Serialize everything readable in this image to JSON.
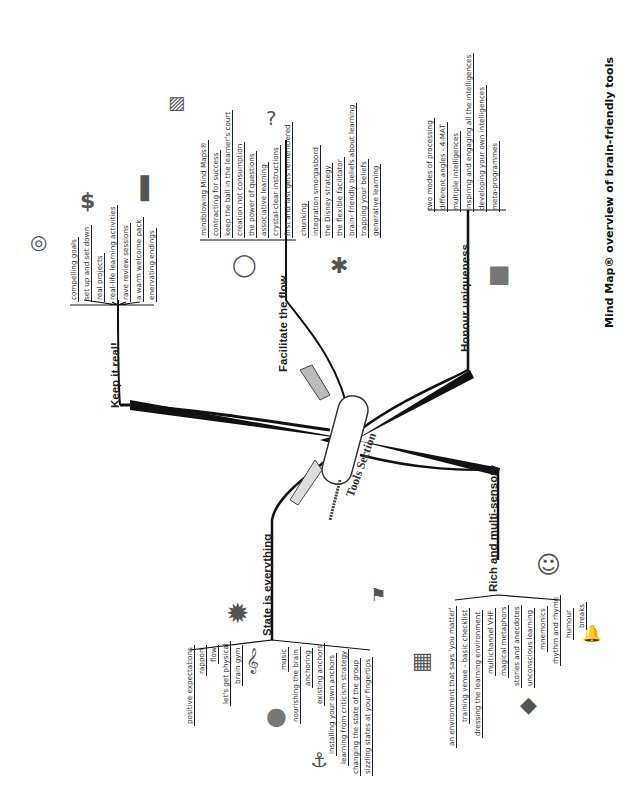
{
  "caption": "Mind Map® overview of brain-friendly tools",
  "center": {
    "label": "Tools Section",
    "icon": "swiss-army-knife-icon"
  },
  "branches": {
    "keep_it_real": {
      "title": "Keep it real!",
      "items": [
        "compelling goals",
        "set up and set down",
        "real projects",
        "real-life learning activities",
        "rave review sessions",
        "a warm welcome pack",
        "enervating endings"
      ],
      "icons": [
        "target-icon",
        "dollar-icon",
        "podium-icon"
      ]
    },
    "facilitate_the_flow": {
      "title": "Facilitate the flow",
      "items": [
        "mindblowing Mind Maps®",
        "contracting for success",
        "keep the ball in the learner's court",
        "creation not consumption",
        "the power of questions",
        "associative learning",
        "crystal-clear instructions",
        "first and last gets remembered",
        "chunking",
        "integration smorgasbord",
        "the Disney strategy",
        "the flexible facilitator",
        "brain- friendly beliefs about learning",
        "trapping your beliefs",
        "generative learning"
      ],
      "icons": [
        "picture-icon",
        "question-mark-icon",
        "baseball-icon",
        "bug-icon"
      ]
    },
    "honour_uniqueness": {
      "title": "Honour uniqueness",
      "items": [
        "two modes of processing",
        "different angles - 4-MAT",
        "multiple intelligences",
        "inspiring and engaging all the intelligences",
        "developing your own intelligences",
        "meta-programmes"
      ],
      "icons": [
        "jack-in-the-box-icon"
      ]
    },
    "state_is_everything": {
      "title": "State is everything",
      "items": [
        "positive expectations",
        "rapport",
        "flow",
        "let's get physical",
        "brain gym",
        "music",
        "nourishing the brain",
        "anchoring",
        "existing anchors",
        "installing your own anchors",
        "learning from criticism strategy",
        "changing the state of the group",
        "sizzling states at your fingertips"
      ],
      "icons": [
        "sun-icon",
        "treble-clef-icon",
        "plate-icon",
        "anchor-icon",
        "hot-flag-icon"
      ]
    },
    "rich_multi_sensory": {
      "title": "Rich and multi-sensory",
      "items": [
        "an environment that says 'you matter'",
        "training venue - basic checklist",
        "dressing the learning environment",
        "multichannel VHF",
        "magical metaphors",
        "stories and anecdotes",
        "unconscious learning",
        "mnemonics",
        "rhythm and rhyme",
        "humour",
        "breaks"
      ],
      "icons": [
        "window-icon",
        "rubiks-cube-icon",
        "laughing-face-icon",
        "bell-icon"
      ]
    }
  },
  "colors": {
    "line": "#111111",
    "text": "#333333",
    "background": "#ffffff"
  }
}
